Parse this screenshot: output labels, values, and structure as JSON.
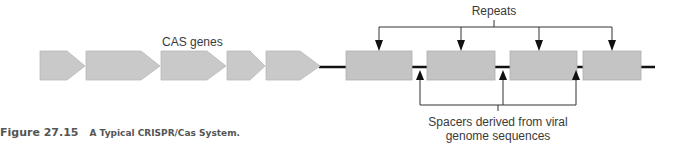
{
  "figure": {
    "number": "Figure 27.15",
    "title": "A Typical CRISPR/Cas System."
  },
  "labels": {
    "cas_genes": "CAS genes",
    "repeats": "Repeats",
    "spacers_line1": "Spacers derived from viral",
    "spacers_line2": "genome sequences"
  },
  "cas_genes": [
    {
      "id": 1
    },
    {
      "id": 2
    },
    {
      "id": 3
    },
    {
      "id": 4
    },
    {
      "id": 5
    }
  ],
  "repeats": [
    {
      "id": 1
    },
    {
      "id": 2
    },
    {
      "id": 3
    },
    {
      "id": 4
    }
  ],
  "spacers": [
    {
      "id": 1
    },
    {
      "id": 2
    },
    {
      "id": 3
    }
  ],
  "colors": {
    "gene_fill": "#c9c9c9",
    "repeat_fill": "#c4c4c4",
    "dna_line": "#111111",
    "text": "#3a3a3a",
    "caption": "#555555"
  }
}
